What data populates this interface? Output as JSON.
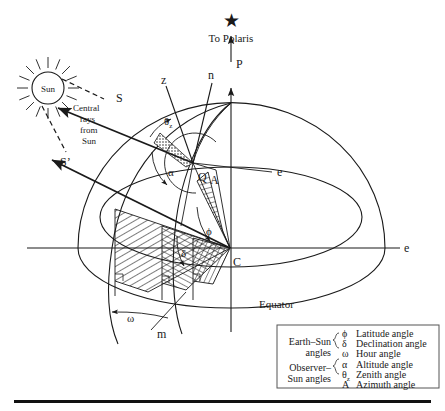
{
  "figure": {
    "title_text": "Earth–Sun and Observer–Sun angle geometry on the celestial sphere",
    "domain": "Diagram"
  },
  "sky": {
    "polaris_star_glyph": "★",
    "polaris_label": "To Polaris",
    "polar_axis_label": "P"
  },
  "sun": {
    "disc_label": "Sun",
    "caption_line1": "Central",
    "caption_line2": "rays",
    "caption_line3": "from",
    "caption_line4": "Sun",
    "ray_upper_label": "S",
    "ray_lower_label": "S’",
    "ray_count": 16
  },
  "axes": {
    "zenith_label": "z",
    "normal_label": "n",
    "east_label_inner": "e",
    "east_label_outer": "e",
    "meridian_label": "m",
    "center_label": "C",
    "observer_label": "Q",
    "equator_label": "Equator"
  },
  "angles": {
    "latitude": "ϕ",
    "declination": "δ",
    "hour": "ω",
    "altitude": "α",
    "zenith_symbol": "θ",
    "zenith_subscript": "z",
    "azimuth": "A"
  },
  "legend": {
    "group1_line1": "Earth–Sun",
    "group1_line2": "angles",
    "group2_line1": "Observer–",
    "group2_line2": "Sun angles",
    "rows": [
      {
        "symbol": "ϕ",
        "sub": "",
        "name": "Latitude angle"
      },
      {
        "symbol": "δ",
        "sub": "",
        "name": "Declination angle"
      },
      {
        "symbol": "ω",
        "sub": "",
        "name": "Hour angle"
      },
      {
        "symbol": "α",
        "sub": "",
        "name": "Altitude angle"
      },
      {
        "symbol": "θ",
        "sub": "z",
        "name": "Zenith angle"
      },
      {
        "symbol": "A",
        "sub": "",
        "name": "Azimuth angle"
      }
    ]
  },
  "colors": {
    "ink": "#1a1a1a",
    "paper": "#ffffff",
    "legend_border": "#555555",
    "rule": "#111111"
  }
}
